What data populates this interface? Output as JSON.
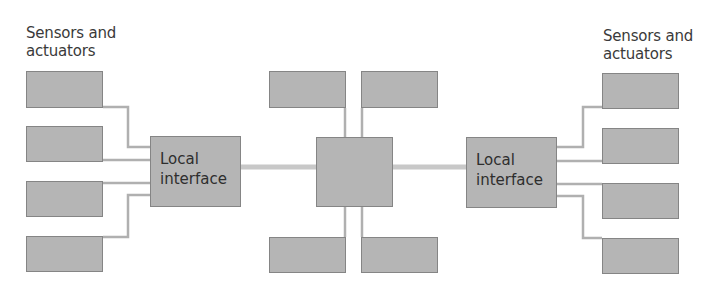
{
  "diagram": {
    "left_group_label_line1": "Sensors and",
    "left_group_label_line2": "actuators",
    "right_group_label_line1": "Sensors and",
    "right_group_label_line2": "actuators",
    "left_local_interface": {
      "line1": "Local",
      "line2": "interface"
    },
    "right_local_interface": {
      "line1": "Local",
      "line2": "interface"
    },
    "nodes": {
      "left_sensors": 4,
      "right_sensors": 4,
      "center_hub": 1,
      "center_top_devices": 2,
      "center_bottom_devices": 2
    },
    "colors": {
      "box_fill": "#b5b5b5",
      "box_border": "#858585",
      "connector": "#b0b0b0",
      "bus": "#c8c8c8",
      "text": "#3a3a3a"
    }
  }
}
